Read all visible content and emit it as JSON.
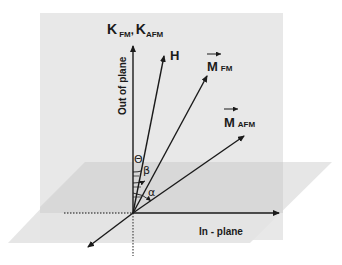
{
  "diagram": {
    "colors": {
      "vertical_plane": "#e6e6e6",
      "horizontal_plane": "#dcdcdc",
      "horizontal_plane_front": "#e8e8e8",
      "arrow": "#1a1a1a",
      "dotted": "#555555"
    },
    "labels": {
      "anisotropy": {
        "main": "K",
        "sub1": "FM",
        "sep": ",",
        "main2": "K",
        "sub2": "AFM"
      },
      "out_of_plane": "Out of plane",
      "field": "H",
      "m_fm": {
        "main": "M",
        "sub": "FM"
      },
      "m_afm": {
        "main": "M",
        "sub": "AFM"
      },
      "in_plane": "In - plane"
    },
    "angles": [
      {
        "symbol": "Θ",
        "between": [
          "K",
          "H"
        ]
      },
      {
        "symbol": "β",
        "between": [
          "K",
          "M_FM"
        ]
      },
      {
        "symbol": "α",
        "between": [
          "K",
          "M_AFM"
        ]
      }
    ],
    "vectors": [
      {
        "name": "K",
        "from": [
          133,
          213
        ],
        "to": [
          133,
          45
        ]
      },
      {
        "name": "H",
        "from": [
          133,
          213
        ],
        "to": [
          164,
          55
        ]
      },
      {
        "name": "M_FM",
        "from": [
          133,
          213
        ],
        "to": [
          207,
          75
        ]
      },
      {
        "name": "M_AFM",
        "from": [
          133,
          213
        ],
        "to": [
          244,
          135
        ]
      },
      {
        "name": "in_plane_x",
        "from": [
          133,
          213
        ],
        "to": [
          279,
          213
        ]
      },
      {
        "name": "in_plane_y",
        "from": [
          133,
          213
        ],
        "to": [
          87,
          248
        ]
      }
    ]
  }
}
